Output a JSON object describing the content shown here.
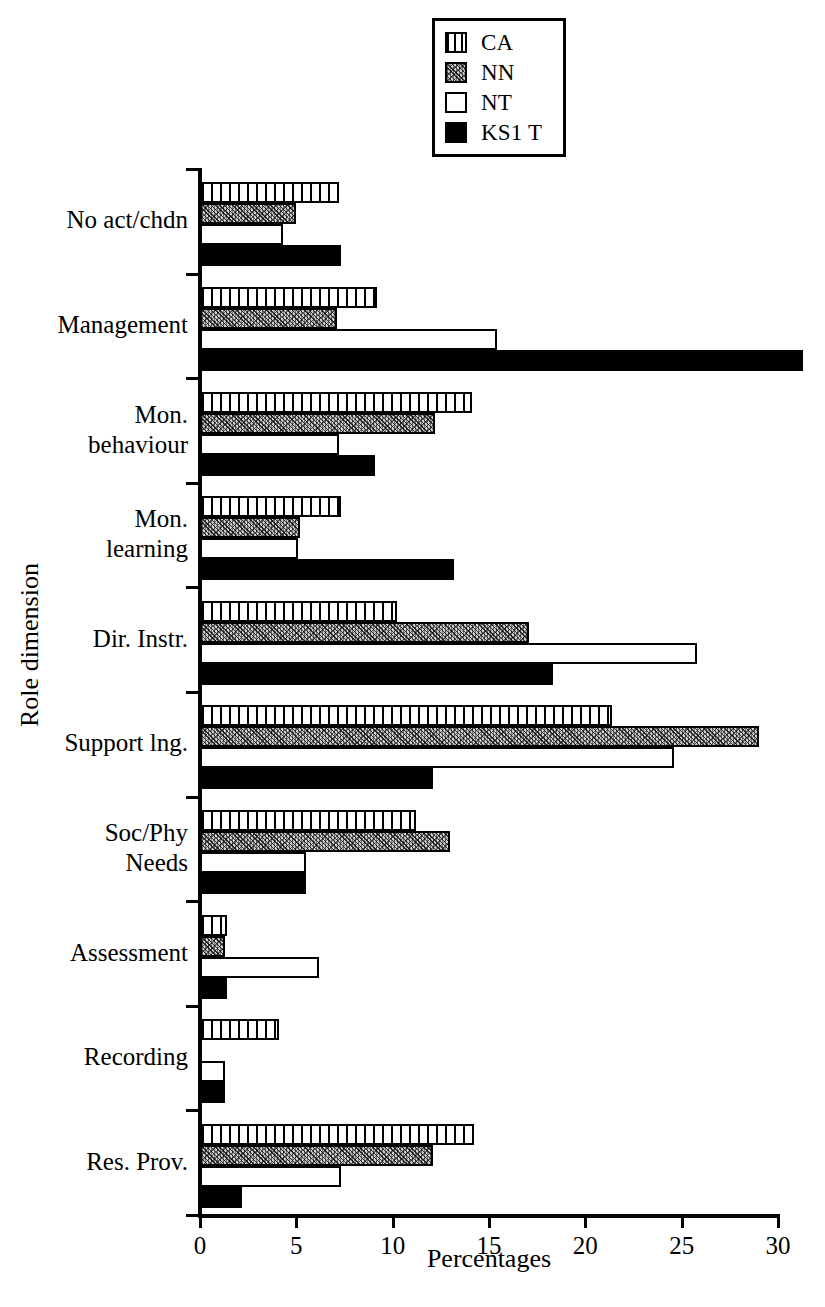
{
  "chart_data": {
    "type": "bar",
    "orientation": "horizontal",
    "title": "",
    "xlabel": "Percentages",
    "ylabel": "Role dimension",
    "xlim": [
      0,
      30
    ],
    "xticks": [
      0,
      5,
      10,
      15,
      20,
      25,
      30
    ],
    "grid": false,
    "legend_position": "top-center",
    "categories": [
      "No act/chdn",
      "Management",
      "Mon.\nbehaviour",
      "Mon.\nlearning",
      "Dir. Instr.",
      "Support lng.",
      "Soc/Phy\nNeeds",
      "Assessment",
      "Recording",
      "Res. Prov."
    ],
    "series": [
      {
        "name": "CA",
        "fill": "vertical-stripes",
        "values": [
          7.2,
          9.2,
          14.1,
          7.3,
          10.2,
          21.4,
          11.2,
          1.4,
          4.1,
          14.2
        ]
      },
      {
        "name": "NN",
        "fill": "stipple",
        "values": [
          5.0,
          7.1,
          12.2,
          5.2,
          17.1,
          29.0,
          13.0,
          1.3,
          0.0,
          12.1
        ]
      },
      {
        "name": "NT",
        "fill": "white",
        "values": [
          4.3,
          15.4,
          7.2,
          5.1,
          25.8,
          24.6,
          5.5,
          6.2,
          1.3,
          7.3
        ]
      },
      {
        "name": "KS1 T",
        "fill": "black",
        "values": [
          7.3,
          31.3,
          9.1,
          13.2,
          18.3,
          12.1,
          5.5,
          1.4,
          1.3,
          2.2
        ]
      }
    ]
  },
  "legend": {
    "items": [
      {
        "label": "CA"
      },
      {
        "label": "NN"
      },
      {
        "label": "NT"
      },
      {
        "label": "KS1 T"
      }
    ]
  },
  "colors": {
    "axis": "#000000",
    "background": "#ffffff",
    "ks1t": "#000000",
    "nn": "#cfcfcf",
    "nt": "#ffffff"
  }
}
